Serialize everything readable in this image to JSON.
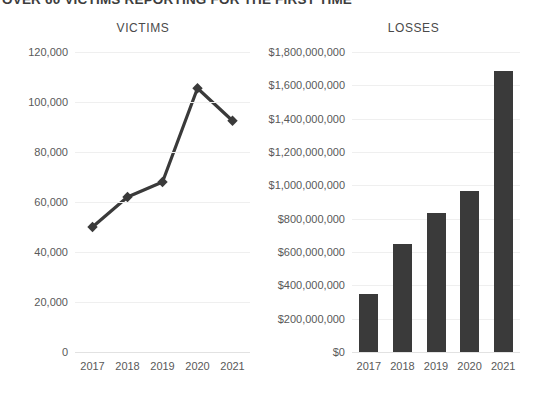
{
  "header": {
    "title": "OVER 60 VICTIMS REPORTING FOR THE FIRST TIME"
  },
  "charts": {
    "victims": {
      "title": "VICTIMS",
      "ytick_labels": [
        "0",
        "20,000",
        "40,000",
        "60,000",
        "80,000",
        "100,000",
        "120,000"
      ],
      "xtick_labels": [
        "2017",
        "2018",
        "2019",
        "2020",
        "2021"
      ]
    },
    "losses": {
      "title": "LOSSES",
      "ytick_labels": [
        "$0",
        "$200,000,000",
        "$400,000,000",
        "$600,000,000",
        "$800,000,000",
        "$1,000,000,000",
        "$1,200,000,000",
        "$1,400,000,000",
        "$1,600,000,000",
        "$1,800,000,000"
      ],
      "xtick_labels": [
        "2017",
        "2018",
        "2019",
        "2020",
        "2021"
      ]
    }
  },
  "colors": {
    "mark": "#3a3a3a",
    "grid": "#efefef",
    "tick_text": "#595959",
    "title_text": "#4a4a4a",
    "background": "#ffffff"
  },
  "chart_data": [
    {
      "type": "line",
      "title": "VICTIMS",
      "xlabel": "",
      "ylabel": "",
      "categories": [
        "2017",
        "2018",
        "2019",
        "2020",
        "2021"
      ],
      "values": [
        50000,
        62000,
        68000,
        105500,
        92500
      ],
      "ylim": [
        0,
        120000
      ],
      "ytick_values": [
        0,
        20000,
        40000,
        60000,
        80000,
        100000,
        120000
      ],
      "grid": true,
      "legend": "none",
      "marker": "diamond",
      "line_color": "#3a3a3a"
    },
    {
      "type": "bar",
      "title": "LOSSES",
      "xlabel": "",
      "ylabel": "",
      "categories": [
        "2017",
        "2018",
        "2019",
        "2020",
        "2021"
      ],
      "values": [
        350000000,
        650000000,
        835000000,
        965000000,
        1685000000
      ],
      "ylim": [
        0,
        1800000000
      ],
      "ytick_values": [
        0,
        200000000,
        400000000,
        600000000,
        800000000,
        1000000000,
        1200000000,
        1400000000,
        1600000000,
        1800000000
      ],
      "grid": true,
      "legend": "none",
      "bar_color": "#3a3a3a"
    }
  ]
}
